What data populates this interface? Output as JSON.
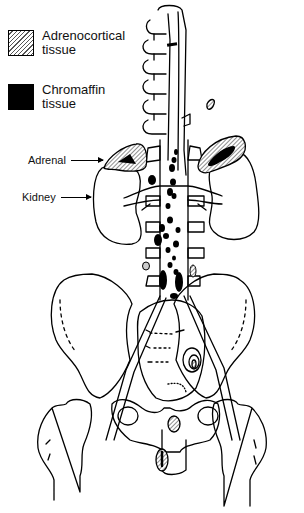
{
  "legend": {
    "items": [
      {
        "label": "Adrenocortical tissue",
        "line1": "Adrenocortical",
        "line2": "tissue",
        "swatch": "hatched"
      },
      {
        "label": "Chromaffin tissue",
        "line1": "Chromaffin",
        "line2": "tissue",
        "swatch": "solid"
      }
    ]
  },
  "callouts": {
    "adrenal": "Adrenal",
    "kidney": "Kidney"
  },
  "caption": {
    "text": "",
    "note": "caption cut off at bottom edge, illegible"
  },
  "colors": {
    "line": "#000000",
    "hatch": "#555555",
    "background": "#ffffff"
  }
}
